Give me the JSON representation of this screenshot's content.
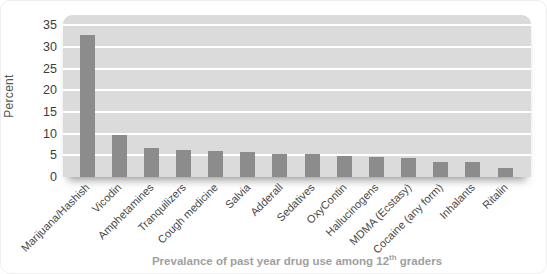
{
  "chart_data": {
    "type": "bar",
    "title": "",
    "caption": {
      "before": "Prevalance of past year drug use among 12",
      "sup": "th",
      "after": " graders"
    },
    "ylabel": "Percent",
    "xlabel": "",
    "categories": [
      "Marijuana/Hashish",
      "Vicodin",
      "Amphetamines",
      "Tranquilizers",
      "Cough medicine",
      "Salvia",
      "Adderall",
      "Sedatives",
      "OxyContin",
      "Hallucinogens",
      "MDMA (Ecstasy)",
      "Cocaine (any form)",
      "Inhalants",
      "Ritalin"
    ],
    "values": [
      32.8,
      9.7,
      6.6,
      6.3,
      5.9,
      5.7,
      5.4,
      5.2,
      4.9,
      4.7,
      4.3,
      3.4,
      3.4,
      2.1
    ],
    "yticks": [
      0,
      5,
      10,
      15,
      20,
      25,
      30,
      35
    ],
    "ylim": [
      0,
      37
    ],
    "grid": true,
    "legend": "none",
    "colors": {
      "bar": "#8c8c8c",
      "plot_background": "#dbdbdb",
      "gridline": "#ffffff",
      "tick_text": "#3d3d3d",
      "caption_text": "#9f9f9f"
    }
  }
}
